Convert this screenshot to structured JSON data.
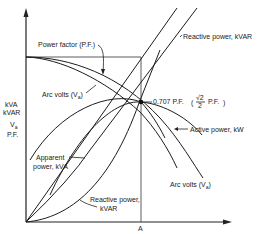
{
  "diagram": {
    "type": "arc-furnace-characteristics",
    "y_axis_labels": [
      "kVA",
      "kVAR",
      "V",
      "P.F."
    ],
    "y_axis_subscript": "a",
    "x_axis_label": "A",
    "curves": {
      "power_factor": "Power factor (P.F.)",
      "arc_volts_upper": "Arc volts (V",
      "arc_volts_lower": "Arc volts (V",
      "arc_volts_sub": "a",
      "arc_volts_close": ")",
      "apparent_power_line1": "Apparent",
      "apparent_power_line2": "power, kVA",
      "reactive_power_top": "Reactive power, kVAR",
      "reactive_power_bottom_line1": "Reactive power,",
      "reactive_power_bottom_line2": "kVAR",
      "active_power": "Active power, kW"
    },
    "marker": {
      "text": "0.707 P.F.",
      "formula_num": "√2",
      "formula_den": "2",
      "formula_suffix": "P.F."
    },
    "colors": {
      "ink": "#1c1c1c",
      "background": "#ffffff"
    }
  }
}
